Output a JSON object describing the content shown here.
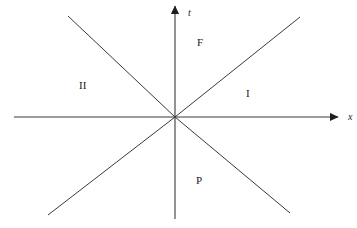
{
  "figure": {
    "type": "minkowski-spacetime-diagram",
    "background_color": "#ffffff",
    "line_color": "#3a3a3a",
    "text_color": "#1a1a1a",
    "width": 357,
    "height": 228,
    "origin": {
      "x": 175,
      "y": 117
    }
  },
  "axes": {
    "horizontal": {
      "label": "x",
      "name": "x-axis",
      "x1": 14,
      "y1": 117,
      "x2": 338,
      "y2": 117,
      "arrow": "right",
      "label_x": 348,
      "label_y": 120
    },
    "vertical": {
      "label": "t",
      "name": "t-axis",
      "x1": 175,
      "y1": 219,
      "x2": 175,
      "y2": 6,
      "arrow": "up",
      "label_x": 188,
      "label_y": 16
    }
  },
  "lightcone_lines": [
    {
      "name": "lightcone-line-upper-right",
      "x1": 175,
      "y1": 117,
      "x2": 300,
      "y2": 17
    },
    {
      "name": "lightcone-line-lower-left",
      "x1": 175,
      "y1": 117,
      "x2": 48,
      "y2": 215
    },
    {
      "name": "lightcone-line-upper-left",
      "x1": 175,
      "y1": 117,
      "x2": 68,
      "y2": 16
    },
    {
      "name": "lightcone-line-lower-right",
      "x1": 175,
      "y1": 117,
      "x2": 290,
      "y2": 213
    }
  ],
  "region_labels": [
    {
      "name": "region-label-future",
      "text": "F",
      "x": 197,
      "y": 46
    },
    {
      "name": "region-label-elsewhere-right",
      "text": "I",
      "x": 246,
      "y": 97
    },
    {
      "name": "region-label-elsewhere-left",
      "text": "II",
      "x": 79,
      "y": 89
    },
    {
      "name": "region-label-past",
      "text": "P",
      "x": 196,
      "y": 184
    }
  ]
}
